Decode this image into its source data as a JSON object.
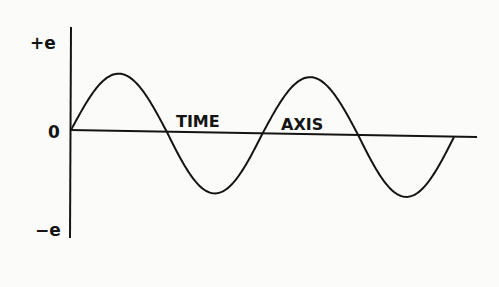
{
  "diagram": {
    "type": "sine-wave",
    "title": "",
    "labels": {
      "y_top": "+e",
      "y_zero": "0",
      "y_bottom": "−e",
      "axis_word_1": "TIME",
      "axis_word_2": "AXIS"
    },
    "cycles": 2,
    "amplitude_label": "e",
    "colors": {
      "ink": "#141414",
      "paper": "#fbfbfa"
    }
  }
}
